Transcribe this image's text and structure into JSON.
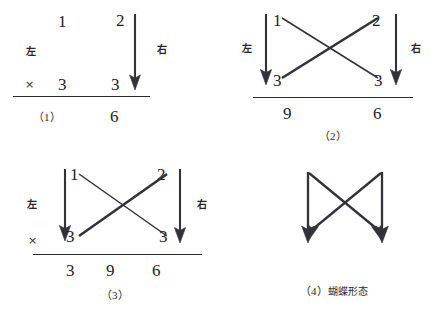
{
  "figure": {
    "background": "#ffffff",
    "ink": "#32323b"
  },
  "panels": [
    {
      "id": "panel-1",
      "caption": "（1）",
      "label_left": "左",
      "label_right": "右",
      "times_symbol": "×",
      "top_row": [
        "1",
        "2"
      ],
      "bottom_row": [
        "3",
        "3"
      ],
      "results": [
        "6"
      ],
      "arrows": [
        "right-down-arrow"
      ],
      "has_cross": false
    },
    {
      "id": "panel-2",
      "caption": "（2）",
      "label_left": "左",
      "label_right": "右",
      "times_symbol": "",
      "top_row": [
        "1",
        "2"
      ],
      "bottom_row": [
        "3",
        "3"
      ],
      "results": [
        "9",
        "6"
      ],
      "arrows": [
        "left-down-arrow",
        "right-down-arrow"
      ],
      "has_cross": true
    },
    {
      "id": "panel-3",
      "caption": "（3）",
      "label_left": "左",
      "label_right": "右",
      "times_symbol": "×",
      "top_row": [
        "1",
        "2"
      ],
      "bottom_row": [
        "3",
        "3"
      ],
      "results": [
        "3",
        "9",
        "6"
      ],
      "arrows": [
        "left-down-arrow",
        "right-down-arrow"
      ],
      "has_cross": true
    },
    {
      "id": "panel-4",
      "caption": "（4）蝴蝶形态",
      "caption_prefix": "（4）",
      "caption_cjk": "蝴蝶形态",
      "shape": "butterfly-bowtie",
      "arrows": [
        "left-down-arrow",
        "right-down-arrow",
        "diagonal-down-left-arrow",
        "diagonal-down-right-arrow"
      ],
      "has_cross": true
    }
  ]
}
